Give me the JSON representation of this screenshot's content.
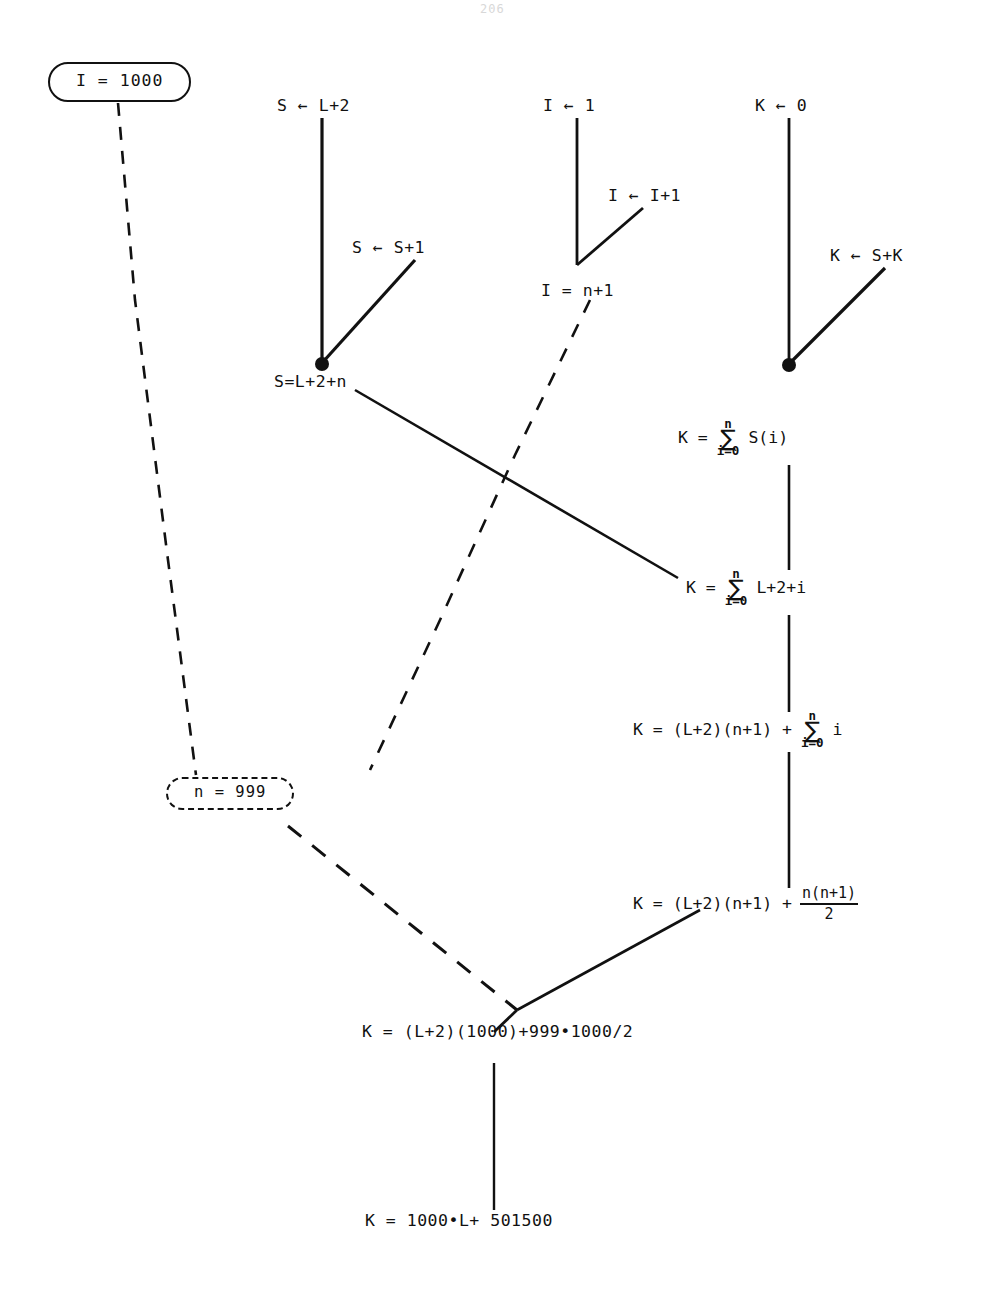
{
  "page": {
    "number": "206",
    "width": 995,
    "height": 1290,
    "background": "#ffffff",
    "ink": "#111111"
  },
  "diagram": {
    "type": "program-verification-derivation-tree",
    "nodes": {
      "input_assertion": {
        "label": "I = 1000",
        "shape": "rounded-rectangle",
        "style": "solid"
      },
      "n_assertion": {
        "label": "n = 999",
        "shape": "rounded-rectangle",
        "style": "dashed"
      },
      "s_init": {
        "label": "S ← L+2"
      },
      "s_incr": {
        "label": "S ← S+1"
      },
      "s_result": {
        "label": "S=L+2+n"
      },
      "i_init": {
        "label": "I ← 1"
      },
      "i_incr": {
        "label": "I ← I+1"
      },
      "i_exit": {
        "label": "I = n+1"
      },
      "k_init": {
        "label": "K ← 0"
      },
      "k_accum": {
        "label": "K ← S+K"
      },
      "k_sum_si": {
        "lead": "K =",
        "upper": "n",
        "sigma": "∑",
        "lower": "i=0",
        "tail": "S(i)"
      },
      "k_sum_expanded": {
        "lead": "K =",
        "upper": "n",
        "sigma": "∑",
        "lower": "i=0",
        "tail": "L+2+i"
      },
      "k_split": {
        "lead": "K =  (L+2)(n+1)  +",
        "upper": "n",
        "sigma": "∑",
        "lower": "i=0",
        "tail": "i"
      },
      "k_closed": {
        "lead": "K =  (L+2)(n+1)  +",
        "numerator": "n(n+1)",
        "denominator": "2"
      },
      "k_numeric": {
        "label": "K =  (L+2)(1000)+999•1000/2"
      },
      "k_final": {
        "label": "K = 1000•L+ 501500"
      }
    },
    "edge_legend": {
      "solid": "derivation / program path",
      "dashed": "substitution of concrete values"
    }
  }
}
